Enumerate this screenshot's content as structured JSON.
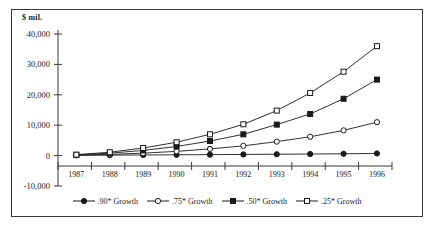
{
  "chart_data": {
    "type": "line",
    "title": "",
    "subtitle": "",
    "xlabel": "",
    "ylabel": "$ mil.",
    "unit_label": "$ mil.",
    "categories": [
      "1987",
      "1988",
      "1989",
      "1990",
      "1991",
      "1992",
      "1993",
      "1994",
      "1995",
      "1996"
    ],
    "x": [
      1987,
      1988,
      1989,
      1990,
      1991,
      1992,
      1993,
      1994,
      1995,
      1996
    ],
    "ylim": [
      -10000,
      40000
    ],
    "yticks": [
      -10000,
      0,
      10000,
      20000,
      30000,
      40000
    ],
    "ytick_labels": [
      "-10,000",
      "0",
      "10,000",
      "20,000",
      "30,000",
      "40,000"
    ],
    "grid": false,
    "legend_position": "bottom",
    "series": [
      {
        "name": ".90* Growth",
        "marker": "filled-circle",
        "values": [
          100,
          150,
          200,
          260,
          320,
          380,
          450,
          520,
          600,
          700
        ]
      },
      {
        "name": ".75* Growth",
        "marker": "open-circle",
        "values": [
          150,
          400,
          800,
          1400,
          2200,
          3200,
          4600,
          6200,
          8300,
          11000
        ]
      },
      {
        "name": ".50* Growth",
        "marker": "filled-square",
        "values": [
          250,
          800,
          1700,
          3000,
          4800,
          7000,
          10200,
          13700,
          18700,
          25000
        ]
      },
      {
        "name": ".25* Growth",
        "marker": "open-square",
        "values": [
          300,
          1100,
          2500,
          4400,
          7000,
          10300,
          14800,
          20600,
          27600,
          36000
        ]
      }
    ]
  },
  "legend": {
    "items": [
      {
        "label": ".90* Growth",
        "marker": "filled-circle"
      },
      {
        "label": ".75* Growth",
        "marker": "open-circle"
      },
      {
        "label": ".50* Growth",
        "marker": "filled-square"
      },
      {
        "label": ".25* Growth",
        "marker": "open-square"
      }
    ]
  }
}
